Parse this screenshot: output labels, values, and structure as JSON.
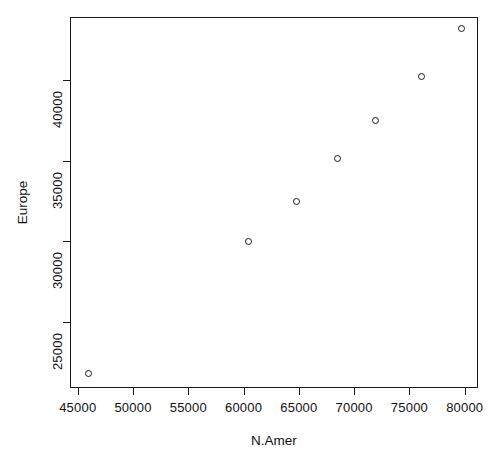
{
  "chart_data": {
    "type": "scatter",
    "title": "",
    "xlabel": "N.Amer",
    "ylabel": "Europe",
    "xlim": [
      44300,
      81200
    ],
    "ylim": [
      20900,
      43900
    ],
    "grid": false,
    "legend": null,
    "marker": "open-circle",
    "xticks": [
      {
        "value": 45000,
        "label": "45000"
      },
      {
        "value": 50000,
        "label": "50000"
      },
      {
        "value": 55000,
        "label": "55000"
      },
      {
        "value": 60000,
        "label": "60000"
      },
      {
        "value": 65000,
        "label": "65000"
      },
      {
        "value": 70000,
        "label": "70000"
      },
      {
        "value": 75000,
        "label": "75000"
      },
      {
        "value": 80000,
        "label": "80000"
      }
    ],
    "yticks": [
      {
        "value": 25000,
        "label": "25000"
      },
      {
        "value": 30000,
        "label": "30000"
      },
      {
        "value": 35000,
        "label": "35000"
      },
      {
        "value": 40000,
        "label": "40000"
      }
    ],
    "points": [
      {
        "x": 46000,
        "y": 21800
      },
      {
        "x": 60400,
        "y": 30000
      },
      {
        "x": 64800,
        "y": 32450
      },
      {
        "x": 68500,
        "y": 35100
      },
      {
        "x": 71900,
        "y": 37500
      },
      {
        "x": 76100,
        "y": 40200
      },
      {
        "x": 79700,
        "y": 43200
      }
    ]
  },
  "colors": {
    "axis": "#1a1a1a",
    "marker": "#1a1a1a",
    "background": "#ffffff"
  },
  "geometry": {
    "plot_left": 70,
    "plot_right": 478,
    "plot_top": 17,
    "plot_bottom": 388
  }
}
